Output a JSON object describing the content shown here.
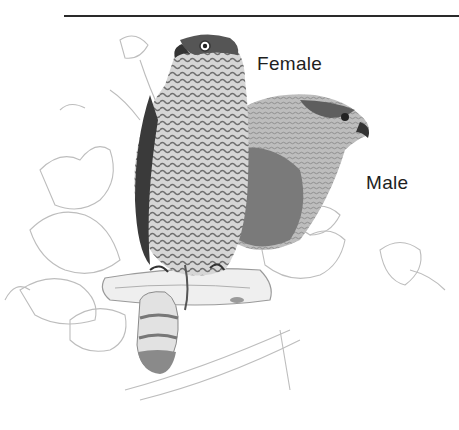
{
  "illustration": {
    "subject": "two hawks perched on a branch among ivy leaves",
    "style": "pencil drawing, grayscale",
    "labels": {
      "female": "Female",
      "male": "Male"
    }
  },
  "colors": {
    "rule": "#2a2a2a",
    "text": "#1e1e1e",
    "dark_plumage": "#4a4a4a",
    "mid_plumage": "#8a8a8a",
    "line_art": "#b5b5b5",
    "background": "#ffffff"
  }
}
